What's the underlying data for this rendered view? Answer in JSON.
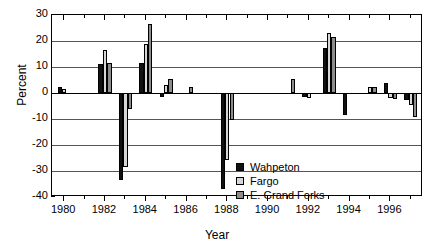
{
  "chart_data": {
    "type": "bar",
    "title": "",
    "xlabel": "Year",
    "ylabel": "Percent",
    "ylim": [
      -40,
      30
    ],
    "ytick_step": 10,
    "yticks": [
      30,
      20,
      10,
      0,
      -10,
      -20,
      -30,
      -40
    ],
    "xlim": [
      1979.4,
      1997.6
    ],
    "xticks_major": [
      1980,
      1982,
      1984,
      1986,
      1988,
      1990,
      1992,
      1994,
      1996
    ],
    "xticks_minor": [
      1981,
      1983,
      1985,
      1987,
      1989,
      1991,
      1993,
      1995,
      1997
    ],
    "xtick_labels": [
      "1980",
      "1982",
      "1984",
      "1986",
      "1988",
      "1990",
      "1992",
      "1994",
      "1996"
    ],
    "grid": "horizontal",
    "legend_position": "inside-lower-right",
    "categories": [
      1980,
      1981,
      1982,
      1983,
      1984,
      1985,
      1986,
      1987,
      1988,
      1989,
      1990,
      1991,
      1992,
      1993,
      1994,
      1995,
      1996,
      1997
    ],
    "series": [
      {
        "name": "Wahpeton",
        "color": "#111111",
        "values": [
          2.5,
          null,
          11.2,
          -33.5,
          11.5,
          -1.6,
          null,
          null,
          -37.0,
          null,
          null,
          null,
          -1.6,
          17.2,
          -8.6,
          null,
          3.7,
          -2.8
        ]
      },
      {
        "name": "Fargo",
        "color": "#d6d6d6",
        "values": [
          1.6,
          null,
          16.6,
          -28.5,
          19.0,
          3.2,
          null,
          null,
          -25.8,
          null,
          null,
          null,
          -2.0,
          23.0,
          null,
          2.2,
          -1.9,
          -4.6
        ]
      },
      {
        "name": "E. Grand Forks",
        "color": "#8c8c8c",
        "values": [
          null,
          null,
          11.7,
          -6.0,
          26.5,
          5.5,
          2.4,
          null,
          -10.2,
          null,
          null,
          5.5,
          null,
          21.6,
          null,
          2.3,
          -2.2,
          -9.3
        ]
      }
    ]
  },
  "legend": {
    "entries": [
      {
        "label": "Wahpeton",
        "swatch": "black-square-icon"
      },
      {
        "label": "Fargo",
        "swatch": "light-gray-square-icon"
      },
      {
        "label": "E. Grand Forks",
        "swatch": "medium-gray-square-icon"
      }
    ]
  },
  "axes": {
    "y_axis_title": "Percent",
    "x_axis_title": "Year"
  }
}
